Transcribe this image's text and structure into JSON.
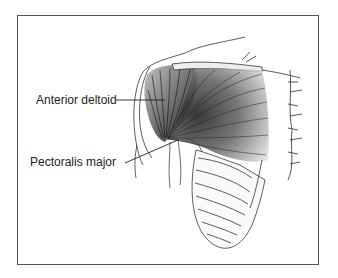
{
  "figure": {
    "labels": [
      {
        "id": "anterior-deltoid",
        "text": "Anterior deltoid"
      },
      {
        "id": "pectoralis-major",
        "text": "Pectoralis major"
      }
    ],
    "colors": {
      "border": "#555555",
      "ink": "#222222",
      "background": "#ffffff"
    }
  }
}
